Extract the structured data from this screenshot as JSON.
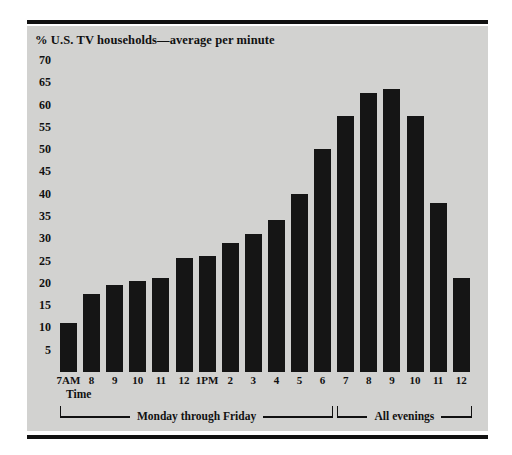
{
  "chart_data": {
    "type": "bar",
    "title": "% U.S. TV households—average per minute",
    "xlabel": "Time",
    "ylabel": "",
    "ylim": [
      0,
      70
    ],
    "ytick_values": [
      70,
      65,
      60,
      55,
      50,
      45,
      40,
      35,
      30,
      25,
      20,
      15,
      10,
      5
    ],
    "grid": false,
    "legend": "none",
    "categories": [
      "7AM",
      "8",
      "9",
      "10",
      "11",
      "12",
      "1PM",
      "2",
      "3",
      "4",
      "5",
      "6",
      "7",
      "8",
      "9",
      "10",
      "11",
      "12"
    ],
    "values": [
      11,
      17.5,
      19.5,
      20.5,
      21,
      25.5,
      26,
      29,
      31,
      34,
      40,
      50,
      57.5,
      62.5,
      63.5,
      57.5,
      38,
      21
    ],
    "groups": [
      {
        "label": "Monday through Friday",
        "start_index": 0,
        "end_index": 11
      },
      {
        "label": "All evenings",
        "start_index": 12,
        "end_index": 17
      }
    ],
    "bar_color": "#151515",
    "panel_color": "#d2d2d0"
  }
}
